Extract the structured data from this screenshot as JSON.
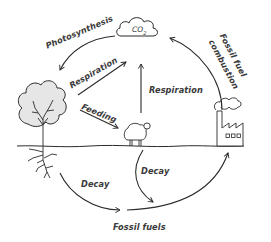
{
  "diagram": {
    "colors": {
      "stroke": "#2b2b2b",
      "text": "#3a3a3a",
      "fill_light": "#e6e6e6",
      "background": "#ffffff"
    },
    "nodes": {
      "co2": {
        "label": "CO",
        "subscript": "2",
        "icon": "cloud-icon"
      },
      "tree": {
        "icon": "tree-icon"
      },
      "sheep": {
        "icon": "sheep-icon"
      },
      "factory": {
        "icon": "factory-icon"
      },
      "fossil_fuels": {
        "label": "Fossil fuels"
      }
    },
    "arrows": {
      "photosynthesis": {
        "label": "Photosynthesis",
        "from": "co2",
        "to": "tree"
      },
      "respiration_tree": {
        "label": "Respiration",
        "from": "tree",
        "to": "co2"
      },
      "feeding": {
        "label": "Feeding",
        "from": "tree",
        "to": "sheep"
      },
      "respiration_sheep": {
        "label": "Respiration",
        "from": "sheep",
        "to": "co2"
      },
      "fossil_fuel_combustion": {
        "label_line1": "Fossil fuel",
        "label_line2": "combustion",
        "from": "factory",
        "to": "co2"
      },
      "decay_tree": {
        "label": "Decay",
        "from": "tree",
        "to": "fossil_fuels"
      },
      "decay_sheep": {
        "label": "Decay",
        "from": "sheep",
        "to": "fossil_fuels"
      },
      "fossil_to_factory": {
        "from": "fossil_fuels",
        "to": "factory"
      }
    }
  }
}
